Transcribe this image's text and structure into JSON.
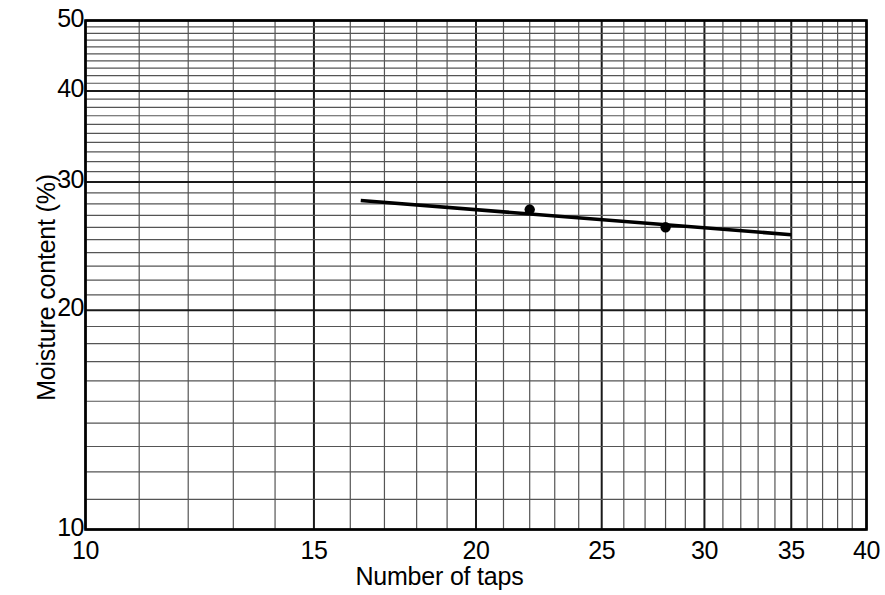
{
  "chart": {
    "title": "",
    "xlabel": "Number of taps",
    "ylabel": "Moisture content (%)",
    "xticks": [
      "10",
      "15",
      "20",
      "25",
      "30",
      "35",
      "40"
    ],
    "yticks": [
      "50",
      "40",
      "30",
      "20",
      "10"
    ]
  },
  "chart_data": {
    "type": "scatter",
    "title": "",
    "subtitle": "",
    "xlabel": "Number of taps",
    "ylabel": "Moisture content (%)",
    "xscale": "log",
    "yscale": "log",
    "xlim": [
      10,
      40
    ],
    "ylim": [
      10,
      50
    ],
    "xticks": [
      10,
      15,
      20,
      25,
      30,
      35,
      40
    ],
    "yticks": [
      10,
      20,
      30,
      40,
      50
    ],
    "x_minor_step": 1,
    "y_minor_step": 1,
    "grid": true,
    "legend": "none",
    "series": [
      {
        "name": "Flow curve data points",
        "marker": "filled-circle",
        "color": "#000000",
        "x": [
          22,
          28
        ],
        "y": [
          27.5,
          26.0
        ]
      },
      {
        "name": "Flow line (best fit)",
        "type": "line",
        "color": "#000000",
        "x": [
          16.3,
          35.0
        ],
        "y": [
          28.3,
          25.4
        ]
      }
    ],
    "annotations": []
  },
  "colors": {
    "axis": "#000000",
    "grid_major": "#1a1a1a",
    "grid_minor": "#555555",
    "line": "#000000",
    "marker": "#000000",
    "background": "#ffffff"
  }
}
